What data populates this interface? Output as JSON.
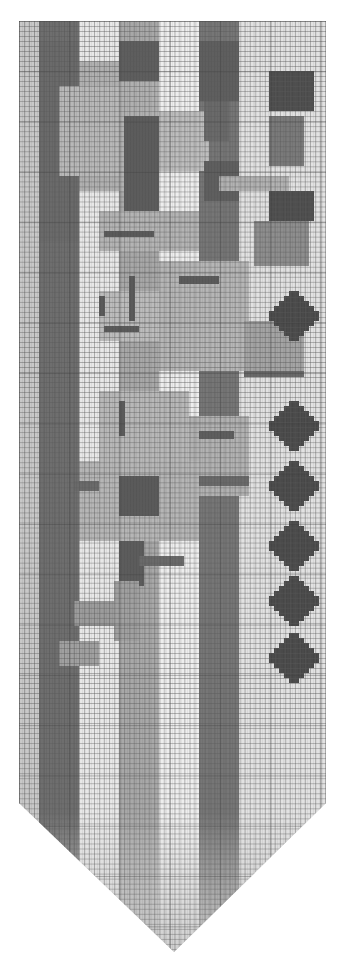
{
  "pattern": {
    "title": "",
    "type": "cross-stitch bell-pull chart (grayscale)",
    "colors": {
      "background_light": "#e6e6e6",
      "stripe_dark": "#6e6e6e",
      "stripe_mid": "#9a9a9a",
      "motif_light": "#b4b4b4",
      "motif_mid": "#8c8c8c",
      "outline_dark": "#5a5a5a",
      "diamond": "#4a4a4a",
      "highlight": "#f4f4f4",
      "grid_line": "#5a5a5a"
    },
    "bands": [
      {
        "left": 0,
        "width": 20,
        "color": "#c8c8c8"
      },
      {
        "left": 20,
        "width": 40,
        "color": "#6e6e6e"
      },
      {
        "left": 60,
        "width": 40,
        "color": "#e8e8e8"
      },
      {
        "left": 100,
        "width": 40,
        "color": "#a8a8a8"
      },
      {
        "left": 140,
        "width": 40,
        "color": "#eeeeee"
      },
      {
        "left": 180,
        "width": 40,
        "color": "#767676"
      },
      {
        "left": 220,
        "width": 87,
        "color": "#e2e2e2"
      }
    ],
    "motifs": [
      {
        "x": 60,
        "y": 40,
        "w": 80,
        "h": 130,
        "c": "#b0b0b0"
      },
      {
        "x": 100,
        "y": 20,
        "w": 40,
        "h": 40,
        "c": "#5e5e5e"
      },
      {
        "x": 20,
        "y": 20,
        "w": 40,
        "h": 200,
        "c": "#6a6a6a"
      },
      {
        "x": 40,
        "y": 65,
        "w": 60,
        "h": 90,
        "c": "#b8b8b8"
      },
      {
        "x": 105,
        "y": 95,
        "w": 35,
        "h": 100,
        "c": "#5c5c5c"
      },
      {
        "x": 140,
        "y": 90,
        "w": 50,
        "h": 60,
        "c": "#bdbdbd"
      },
      {
        "x": 180,
        "y": 20,
        "w": 40,
        "h": 60,
        "c": "#5f5f5f"
      },
      {
        "x": 185,
        "y": 80,
        "w": 25,
        "h": 40,
        "c": "#6a6a6a"
      },
      {
        "x": 185,
        "y": 140,
        "w": 35,
        "h": 40,
        "c": "#5f5f5f"
      },
      {
        "x": 200,
        "y": 155,
        "w": 70,
        "h": 15,
        "c": "#b2b2b2"
      },
      {
        "x": 250,
        "y": 50,
        "w": 45,
        "h": 40,
        "c": "#4e4e4e"
      },
      {
        "x": 250,
        "y": 95,
        "w": 35,
        "h": 50,
        "c": "#7a7a7a"
      },
      {
        "x": 250,
        "y": 170,
        "w": 45,
        "h": 30,
        "c": "#4e4e4e"
      },
      {
        "x": 235,
        "y": 200,
        "w": 55,
        "h": 45,
        "c": "#8e8e8e"
      },
      {
        "x": 80,
        "y": 190,
        "w": 100,
        "h": 40,
        "c": "#b4b4b4"
      },
      {
        "x": 85,
        "y": 210,
        "w": 50,
        "h": 6,
        "c": "#5a5a5a"
      },
      {
        "x": 140,
        "y": 240,
        "w": 90,
        "h": 110,
        "c": "#b6b6b6"
      },
      {
        "x": 160,
        "y": 255,
        "w": 40,
        "h": 8,
        "c": "#5a5a5a"
      },
      {
        "x": 80,
        "y": 270,
        "w": 60,
        "h": 50,
        "c": "#bcbcbc"
      },
      {
        "x": 80,
        "y": 275,
        "w": 6,
        "h": 20,
        "c": "#5a5a5a"
      },
      {
        "x": 85,
        "y": 305,
        "w": 35,
        "h": 6,
        "c": "#5a5a5a"
      },
      {
        "x": 110,
        "y": 255,
        "w": 6,
        "h": 45,
        "c": "#5a5a5a"
      },
      {
        "x": 225,
        "y": 300,
        "w": 60,
        "h": 50,
        "c": "#a4a4a4"
      },
      {
        "x": 225,
        "y": 350,
        "w": 60,
        "h": 6,
        "c": "#6a6a6a"
      },
      {
        "x": 80,
        "y": 370,
        "w": 90,
        "h": 90,
        "c": "#b8b8b8"
      },
      {
        "x": 100,
        "y": 380,
        "w": 6,
        "h": 35,
        "c": "#5a5a5a"
      },
      {
        "x": 170,
        "y": 395,
        "w": 60,
        "h": 80,
        "c": "#b2b2b2"
      },
      {
        "x": 180,
        "y": 410,
        "w": 35,
        "h": 8,
        "c": "#5e5e5e"
      },
      {
        "x": 60,
        "y": 440,
        "w": 120,
        "h": 80,
        "c": "#b6b6b6"
      },
      {
        "x": 100,
        "y": 455,
        "w": 40,
        "h": 40,
        "c": "#5a5a5a"
      },
      {
        "x": 55,
        "y": 460,
        "w": 25,
        "h": 10,
        "c": "#6a6a6a"
      },
      {
        "x": 180,
        "y": 455,
        "w": 50,
        "h": 10,
        "c": "#6a6a6a"
      },
      {
        "x": 100,
        "y": 520,
        "w": 25,
        "h": 45,
        "c": "#5c5c5c"
      },
      {
        "x": 120,
        "y": 535,
        "w": 45,
        "h": 10,
        "c": "#6a6a6a"
      },
      {
        "x": 95,
        "y": 560,
        "w": 25,
        "h": 60,
        "c": "#a0a0a0"
      },
      {
        "x": 55,
        "y": 580,
        "w": 40,
        "h": 25,
        "c": "#9c9c9c"
      },
      {
        "x": 40,
        "y": 620,
        "w": 40,
        "h": 25,
        "c": "#a0a0a0"
      }
    ],
    "diamonds": [
      {
        "x": 250,
        "y": 270,
        "c": "#4a4a4a"
      },
      {
        "x": 250,
        "y": 380,
        "c": "#4a4a4a"
      },
      {
        "x": 250,
        "y": 440,
        "c": "#4a4a4a"
      },
      {
        "x": 250,
        "y": 500,
        "c": "#4a4a4a"
      },
      {
        "x": 250,
        "y": 555,
        "c": "#4a4a4a"
      },
      {
        "x": 250,
        "y": 612,
        "c": "#4a4a4a"
      }
    ],
    "grid": {
      "columns": 61,
      "rows_rect": 155,
      "cell_px": 5
    }
  }
}
